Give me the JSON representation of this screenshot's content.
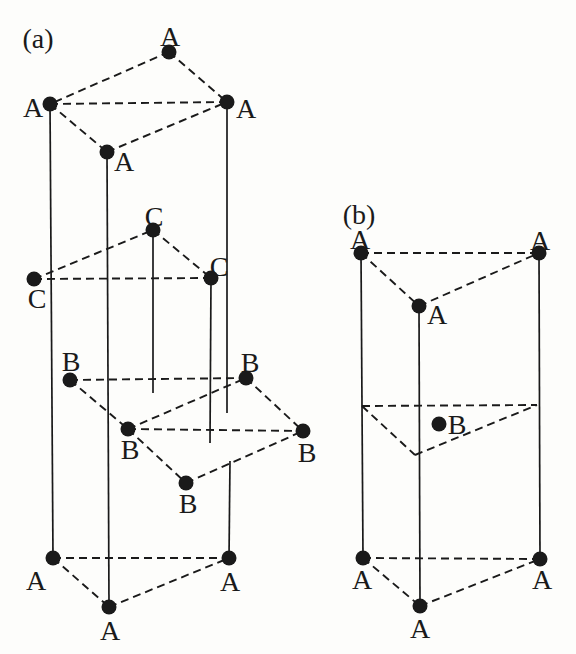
{
  "style": {
    "background": "#fdfdfb",
    "ink": "#1a1a1a",
    "dot_radius": 7.5,
    "solid_width": 1.7,
    "dashed_width": 1.9,
    "dash_pattern": "8 5"
  },
  "panels": [
    {
      "id": "a",
      "label": "(a)",
      "label_x": 38,
      "label_y": 38,
      "atoms": [
        {
          "el": "A",
          "x": 169,
          "y": 52,
          "lx": 170,
          "ly": 36
        },
        {
          "el": "A",
          "x": 50,
          "y": 104,
          "lx": 33,
          "ly": 107
        },
        {
          "el": "A",
          "x": 227,
          "y": 102,
          "lx": 246,
          "ly": 108
        },
        {
          "el": "A",
          "x": 107,
          "y": 152,
          "lx": 124,
          "ly": 161
        },
        {
          "el": "C",
          "x": 153,
          "y": 230,
          "lx": 154,
          "ly": 216
        },
        {
          "el": "C",
          "x": 34,
          "y": 279,
          "lx": 37,
          "ly": 298
        },
        {
          "el": "C",
          "x": 211,
          "y": 278,
          "lx": 219,
          "ly": 266
        },
        {
          "el": "B",
          "x": 70,
          "y": 380,
          "lx": 71,
          "ly": 361
        },
        {
          "el": "B",
          "x": 246,
          "y": 378,
          "lx": 250,
          "ly": 362
        },
        {
          "el": "B",
          "x": 128,
          "y": 429,
          "lx": 130,
          "ly": 449
        },
        {
          "el": "B",
          "x": 303,
          "y": 431,
          "lx": 307,
          "ly": 452
        },
        {
          "el": "B",
          "x": 186,
          "y": 483,
          "lx": 188,
          "ly": 503
        },
        {
          "el": "A",
          "x": 53,
          "y": 558,
          "lx": 36,
          "ly": 580
        },
        {
          "el": "A",
          "x": 229,
          "y": 558,
          "lx": 230,
          "ly": 581
        },
        {
          "el": "A",
          "x": 109,
          "y": 607,
          "lx": 110,
          "ly": 630
        }
      ],
      "dashed_bonds": [
        [
          0,
          1
        ],
        [
          0,
          2
        ],
        [
          1,
          2
        ],
        [
          1,
          3
        ],
        [
          3,
          2
        ],
        [
          5,
          4
        ],
        [
          4,
          6
        ],
        [
          5,
          6
        ],
        [
          7,
          8
        ],
        [
          7,
          9
        ],
        [
          9,
          8
        ],
        [
          9,
          10
        ],
        [
          8,
          10
        ],
        [
          9,
          11
        ],
        [
          11,
          10
        ],
        [
          12,
          13
        ],
        [
          12,
          14
        ],
        [
          14,
          13
        ]
      ],
      "dashed_lines": [],
      "solid_lines": [
        [
          50,
          104,
          53,
          558
        ],
        [
          107,
          152,
          109,
          607
        ],
        [
          227,
          102,
          227,
          413
        ],
        [
          230,
          461,
          229,
          558
        ],
        [
          153,
          230,
          153,
          393
        ],
        [
          211,
          278,
          210,
          443
        ]
      ]
    },
    {
      "id": "b",
      "label": "(b)",
      "label_x": 359,
      "label_y": 214,
      "atoms": [
        {
          "el": "A",
          "x": 361,
          "y": 253,
          "lx": 360,
          "ly": 239
        },
        {
          "el": "A",
          "x": 539,
          "y": 253,
          "lx": 540,
          "ly": 240
        },
        {
          "el": "A",
          "x": 419,
          "y": 306,
          "lx": 437,
          "ly": 314
        },
        {
          "el": "B",
          "x": 439,
          "y": 424,
          "lx": 457,
          "ly": 424
        },
        {
          "el": "A",
          "x": 363,
          "y": 558,
          "lx": 362,
          "ly": 579
        },
        {
          "el": "A",
          "x": 540,
          "y": 559,
          "lx": 542,
          "ly": 579
        },
        {
          "el": "A",
          "x": 420,
          "y": 606,
          "lx": 420,
          "ly": 628
        }
      ],
      "dashed_bonds": [
        [
          0,
          1
        ],
        [
          0,
          2
        ],
        [
          2,
          1
        ],
        [
          4,
          5
        ],
        [
          4,
          6
        ],
        [
          6,
          5
        ]
      ],
      "dashed_lines": [
        [
          362,
          406,
          537,
          405
        ],
        [
          362,
          406,
          415,
          455
        ],
        [
          415,
          455,
          537,
          405
        ]
      ],
      "solid_lines": [
        [
          361,
          253,
          363,
          558
        ],
        [
          419,
          306,
          420,
          606
        ],
        [
          539,
          253,
          540,
          559
        ]
      ]
    }
  ]
}
